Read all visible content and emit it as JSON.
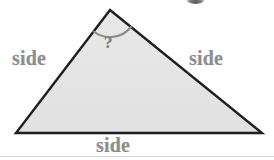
{
  "figure": {
    "width": 274,
    "height": 160,
    "background_color": "#ffffff"
  },
  "diagram": {
    "shape": "triangle",
    "fill_color": "#e4e4e4",
    "stroke_color": "#1f1f1f",
    "stroke_width": 2.4,
    "vertices": {
      "apex": {
        "x": 110,
        "y": 10
      },
      "bottom_left": {
        "x": 16,
        "y": 133
      },
      "bottom_right": {
        "x": 262,
        "y": 133
      }
    },
    "angle_arc": {
      "at_vertex": "apex",
      "color": "#8a8a8a",
      "stroke_width": 2,
      "radius": 27
    }
  },
  "labels": {
    "left_side": "side",
    "right_side": "side",
    "bottom_side": "side",
    "angle": "?"
  },
  "colors": {
    "label_text": "#8e8e8e",
    "angle_text": "#7d7d7d",
    "outline": "#1f1f1f",
    "interior": "#e4e4e4"
  }
}
